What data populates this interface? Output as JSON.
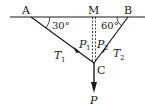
{
  "diagram": {
    "points": {
      "A": "A",
      "M": "M",
      "B": "B",
      "C": "C"
    },
    "angles": {
      "left": "30°",
      "right": "60°"
    },
    "forces": {
      "T1": {
        "sym": "T",
        "sub": "1"
      },
      "T2": {
        "sym": "T",
        "sub": "2"
      },
      "P1": {
        "sym": "P",
        "sub": "1"
      },
      "P2": {
        "sym": "P",
        "sub": "2"
      },
      "P": {
        "sym": "P"
      }
    },
    "colors": {
      "stroke": "#1a1a1a",
      "background": "#ffffff"
    }
  }
}
